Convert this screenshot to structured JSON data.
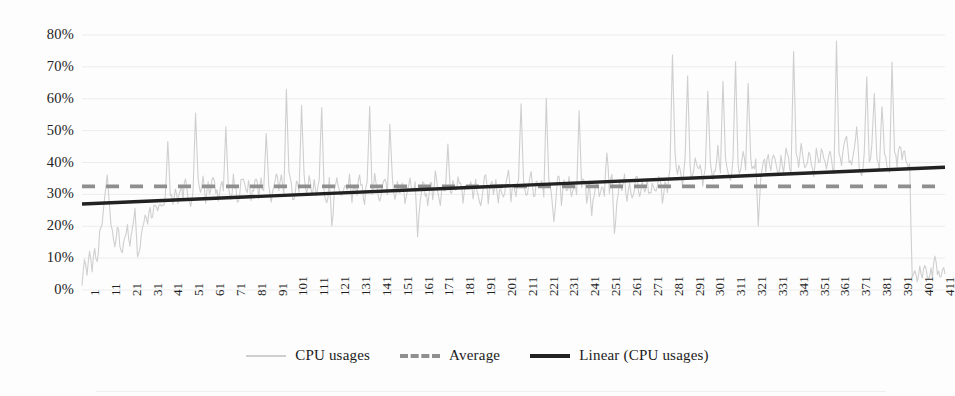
{
  "chart_data": {
    "type": "line",
    "title": "",
    "xlabel": "",
    "ylabel": "",
    "ylim": [
      0,
      0.8
    ],
    "xlim": [
      1,
      415
    ],
    "grid": true,
    "y_tick_labels": [
      "80%",
      "70%",
      "60%",
      "50%",
      "40%",
      "30%",
      "20%",
      "10%",
      "0%"
    ],
    "y_tick_values": [
      0.8,
      0.7,
      0.6,
      0.5,
      0.4,
      0.3,
      0.2,
      0.1,
      0.0
    ],
    "x_tick_labels": [
      "1",
      "11",
      "21",
      "31",
      "41",
      "51",
      "61",
      "71",
      "81",
      "91",
      "101",
      "111",
      "121",
      "131",
      "141",
      "151",
      "161",
      "171",
      "181",
      "191",
      "201",
      "211",
      "221",
      "231",
      "241",
      "251",
      "261",
      "271",
      "281",
      "291",
      "301",
      "311",
      "321",
      "331",
      "341",
      "351",
      "361",
      "371",
      "381",
      "391",
      "401",
      "411"
    ],
    "x_tick_values": [
      1,
      11,
      21,
      31,
      41,
      51,
      61,
      71,
      81,
      91,
      101,
      111,
      121,
      131,
      141,
      151,
      161,
      171,
      181,
      191,
      201,
      211,
      221,
      231,
      241,
      251,
      261,
      271,
      281,
      291,
      301,
      311,
      321,
      331,
      341,
      351,
      361,
      371,
      381,
      391,
      401,
      411
    ],
    "legend_position": "bottom",
    "series": [
      {
        "name": "CPU usages",
        "kind": "line",
        "color": "#cfcfcf",
        "values": [
          3,
          8,
          5,
          11,
          7,
          14,
          9,
          17,
          22,
          30,
          37,
          25,
          18,
          12,
          20,
          15,
          11,
          16,
          21,
          14,
          20,
          26,
          10,
          14,
          19,
          24,
          22,
          25,
          23,
          27,
          26,
          28,
          25,
          29,
          47,
          31,
          26,
          30,
          27,
          33,
          29,
          36,
          30,
          27,
          31,
          55,
          35,
          30,
          34,
          28,
          33,
          30,
          36,
          32,
          28,
          34,
          31,
          51,
          33,
          29,
          35,
          31,
          27,
          33,
          36,
          30,
          34,
          28,
          32,
          36,
          30,
          35,
          31,
          49,
          34,
          29,
          33,
          37,
          31,
          35,
          30,
          63,
          36,
          32,
          27,
          34,
          30,
          58,
          35,
          31,
          36,
          29,
          33,
          30,
          35,
          57,
          31,
          27,
          34,
          19,
          30,
          36,
          32,
          28,
          34,
          31,
          35,
          29,
          33,
          30,
          36,
          32,
          28,
          34,
          57,
          30,
          35,
          31,
          27,
          33,
          36,
          30,
          52,
          34,
          29,
          33,
          31,
          35,
          28,
          32,
          36,
          30,
          34,
          15,
          29,
          33,
          31,
          27,
          35,
          30,
          36,
          32,
          28,
          34,
          31,
          46,
          29,
          33,
          30,
          36,
          32,
          28,
          34,
          31,
          35,
          29,
          33,
          30,
          26,
          32,
          36,
          28,
          34,
          31,
          35,
          29,
          33,
          30,
          32,
          36,
          28,
          34,
          31,
          35,
          58,
          33,
          30,
          32,
          36,
          28,
          34,
          31,
          35,
          29,
          60,
          33,
          30,
          20,
          32,
          36,
          28,
          34,
          31,
          35,
          29,
          33,
          30,
          56,
          32,
          36,
          28,
          34,
          22,
          31,
          35,
          29,
          33,
          30,
          43,
          32,
          36,
          19,
          28,
          34,
          31,
          35,
          29,
          33,
          30,
          32,
          36,
          28,
          34,
          31,
          35,
          29,
          33,
          30,
          32,
          36,
          28,
          34,
          31,
          38,
          74,
          42,
          36,
          39,
          33,
          41,
          67,
          38,
          35,
          42,
          37,
          40,
          34,
          38,
          62,
          41,
          36,
          39,
          44,
          37,
          66,
          42,
          38,
          35,
          41,
          72,
          39,
          36,
          43,
          38,
          65,
          41,
          37,
          40,
          19,
          36,
          42,
          38,
          41,
          37,
          43,
          39,
          36,
          42,
          38,
          44,
          40,
          37,
          75,
          43,
          39,
          46,
          41,
          38,
          44,
          40,
          37,
          43,
          39,
          45,
          41,
          38,
          44,
          40,
          37,
          78,
          43,
          39,
          46,
          48,
          41,
          38,
          44,
          51,
          40,
          37,
          43,
          67,
          39,
          45,
          62,
          41,
          38,
          58,
          44,
          40,
          37,
          72,
          43,
          39,
          45,
          41,
          44,
          38,
          40,
          3,
          5,
          4,
          7,
          5,
          8,
          4,
          6,
          5,
          9,
          6,
          4,
          7,
          5
        ]
      },
      {
        "name": "Average",
        "kind": "constant-line",
        "style": "dashed",
        "color": "#8f8f8f",
        "value": 0.325
      },
      {
        "name": "Linear (CPU usages)",
        "kind": "trendline",
        "style": "solid",
        "color": "#222222",
        "start_value": 0.27,
        "end_value": 0.385
      }
    ]
  },
  "legend": {
    "items": [
      {
        "label": "CPU usages",
        "swatch": "series-line-swatch"
      },
      {
        "label": "Average",
        "swatch": "average-dashed-swatch"
      },
      {
        "label": "Linear (CPU usages)",
        "swatch": "trend-solid-swatch"
      }
    ]
  },
  "colors": {
    "series": "#cfcfcf",
    "average": "#8f8f8f",
    "trend": "#222222",
    "gridline": "#ececec",
    "text": "#1c1c1c",
    "background": "#fdfdfd"
  }
}
